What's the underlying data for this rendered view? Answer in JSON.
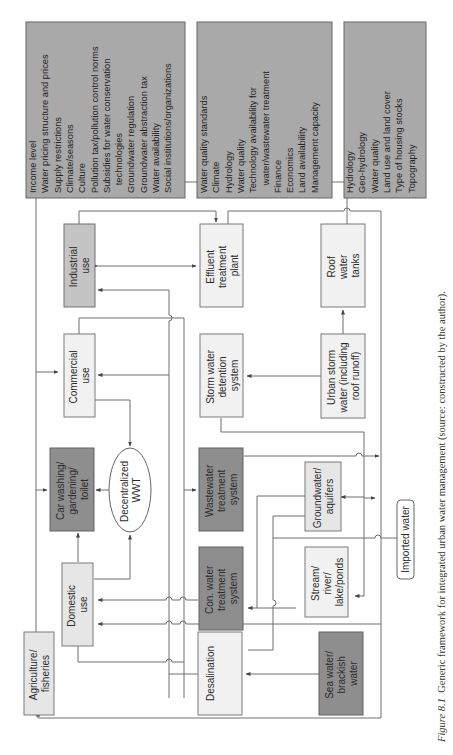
{
  "orientation": "rotated-90-ccw",
  "caption": {
    "figure_label": "Figure 8.1",
    "text": "  Generic framework for integrated urban water management (source: constructed by the author)."
  },
  "factor_boxes": {
    "socio_economic": {
      "lines": [
        "Income level",
        "Water pricing structure and prices",
        "Supply restrictions",
        "Climate/seasons",
        "Culture",
        "Pollution tax/pollution control norms",
        "Subsidies for water conservation",
        "   technologies",
        "Groundwater regulation",
        "Groundwater abstraction tax",
        "Water availability",
        "Social institutions/organizations"
      ]
    },
    "technical": {
      "lines": [
        "Water quality standards",
        "Climate",
        "Hydrology",
        "Water quality",
        "Technology availability for",
        "   water/wastewater treatment",
        "Finance",
        "Economics",
        "Land availability",
        "Management capacity"
      ]
    },
    "physical": {
      "lines": [
        "Hydrology",
        "Geo-hydrology",
        "Water quality",
        "Land use and land cover",
        "Type of housing stocks",
        "Topography"
      ]
    }
  },
  "nodes": {
    "industrial": {
      "lines": [
        "Industrial",
        "use"
      ]
    },
    "commercial": {
      "lines": [
        "Commercial",
        "use"
      ]
    },
    "car_washing": {
      "lines": [
        "Car washing/",
        "gardening/",
        "toilet"
      ]
    },
    "domestic": {
      "lines": [
        "Domestic",
        "use"
      ]
    },
    "agriculture": {
      "lines": [
        "Agriculture/",
        "fisheries"
      ]
    },
    "decentralized_wwt": {
      "lines": [
        "Decentralized",
        "WWT"
      ]
    },
    "effluent": {
      "lines": [
        "Effluent",
        "treatment",
        "plant"
      ]
    },
    "storm_detention": {
      "lines": [
        "Storm water",
        "detention",
        "system"
      ]
    },
    "wastewater": {
      "lines": [
        "Wastewater",
        "treatment",
        "system"
      ]
    },
    "con_water": {
      "lines": [
        "Con. water",
        "treatment",
        "system"
      ]
    },
    "desalination": {
      "lines": [
        "Desalination"
      ]
    },
    "roof_tanks": {
      "lines": [
        "Roof",
        "water",
        "tanks"
      ]
    },
    "urban_storm": {
      "lines": [
        "Urban storm",
        "water (including",
        "roof runoff)"
      ]
    },
    "groundwater": {
      "lines": [
        "Groundwater/",
        "aquifers"
      ]
    },
    "stream": {
      "lines": [
        "Stream/",
        "river/",
        "lake/ponds"
      ]
    },
    "sea_water": {
      "lines": [
        "Sea water/",
        "brackish",
        "water"
      ]
    },
    "imported_water": {
      "lines": [
        "Imported water"
      ]
    }
  },
  "colors": {
    "factor_fill": "#a9a9a9",
    "dark_fill": "#8e8e8e",
    "mid_fill": "#c4c4c4",
    "light_fill": "#e6e6e6",
    "lighter_fill": "#f1f1f1",
    "line": "#6e6e6e"
  }
}
